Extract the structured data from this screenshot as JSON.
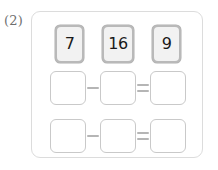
{
  "problem": {
    "number_label": "(2)",
    "panel_name": "problem-panel"
  },
  "number_tiles": [
    {
      "value": "7",
      "name": "number-tile-7"
    },
    {
      "value": "16",
      "name": "number-tile-16"
    },
    {
      "value": "9",
      "name": "number-tile-9"
    }
  ],
  "equations": [
    {
      "row": 1,
      "minuend": "",
      "subtrahend": "",
      "difference": "",
      "minus_symbol": "−",
      "equals_symbol": "="
    },
    {
      "row": 2,
      "minuend": "",
      "subtrahend": "",
      "difference": "",
      "minus_symbol": "−",
      "equals_symbol": "="
    }
  ],
  "colors": {
    "panel_border": "#dcdcdc",
    "tile_border": "#b9b9b9",
    "tile_face": "#f2f2f2",
    "tile_text": "#1a1a1a",
    "box_border": "#c9c9c9",
    "operator": "#b5b5b5",
    "label_text": "#6e6e6e",
    "background": "#ffffff"
  }
}
